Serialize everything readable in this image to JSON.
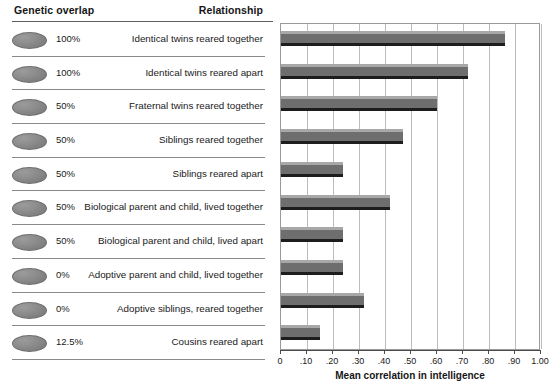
{
  "table": {
    "headers": {
      "genetic_overlap": "Genetic overlap",
      "relationship": "Relationship"
    },
    "rows": [
      {
        "icon": "gray-disc-icon",
        "genetic_overlap": "100%",
        "relationship": "Identical twins reared together"
      },
      {
        "icon": "gray-disc-icon",
        "genetic_overlap": "100%",
        "relationship": "Identical twins reared apart"
      },
      {
        "icon": "gray-disc-icon",
        "genetic_overlap": "50%",
        "relationship": "Fraternal twins reared together"
      },
      {
        "icon": "gray-disc-icon",
        "genetic_overlap": "50%",
        "relationship": "Siblings reared together"
      },
      {
        "icon": "gray-disc-icon",
        "genetic_overlap": "50%",
        "relationship": "Siblings reared apart"
      },
      {
        "icon": "gray-disc-icon",
        "genetic_overlap": "50%",
        "relationship": "Biological parent and child, lived together"
      },
      {
        "icon": "gray-disc-icon",
        "genetic_overlap": "50%",
        "relationship": "Biological parent and child, lived apart"
      },
      {
        "icon": "gray-disc-icon",
        "genetic_overlap": "0%",
        "relationship": "Adoptive parent and child, lived together"
      },
      {
        "icon": "gray-disc-icon",
        "genetic_overlap": "0%",
        "relationship": "Adoptive siblings, reared together"
      },
      {
        "icon": "gray-disc-icon",
        "genetic_overlap": "12.5%",
        "relationship": "Cousins reared apart"
      }
    ]
  },
  "colors": {
    "bar_fill": "#6e6e6e",
    "bar_highlight": "#a8a8a8",
    "bar_shadow": "#1d1d1d",
    "gridline": "#bdbdbd",
    "axis": "#4a4a4a",
    "disc": "#8d8d8d"
  },
  "chart_data": {
    "type": "bar",
    "orientation": "horizontal",
    "title": "",
    "xlabel": "Mean correlation in intelligence",
    "ylabel": "",
    "xlim": [
      0,
      1.0
    ],
    "grid": true,
    "legend": "none",
    "xticks": [
      0,
      0.1,
      0.2,
      0.3,
      0.4,
      0.5,
      0.6,
      0.7,
      0.8,
      0.9,
      1.0
    ],
    "xticklabels": [
      "0",
      ".10",
      ".20",
      ".30",
      ".40",
      ".50",
      ".60",
      ".70",
      ".80",
      ".90",
      "1.00"
    ],
    "categories": [
      "Identical twins reared together",
      "Identical twins reared apart",
      "Fraternal twins reared together",
      "Siblings reared together",
      "Siblings reared apart",
      "Biological parent and child, lived together",
      "Biological parent and child, lived apart",
      "Adoptive parent and child, lived together",
      "Adoptive siblings, reared together",
      "Cousins reared apart"
    ],
    "values": [
      0.86,
      0.72,
      0.6,
      0.47,
      0.24,
      0.42,
      0.24,
      0.24,
      0.32,
      0.15
    ]
  }
}
